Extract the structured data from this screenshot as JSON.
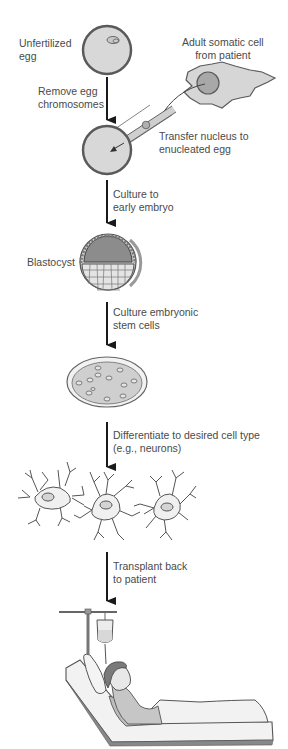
{
  "diagram": {
    "labels": {
      "unfertilized_egg": [
        "Unfertilized",
        "egg"
      ],
      "adult_cell": [
        "Adult somatic cell",
        "from patient"
      ],
      "remove_chromosomes": [
        "Remove egg",
        "chromosomes"
      ],
      "transfer_nucleus": [
        "Transfer nucleus to",
        "enucleated egg"
      ],
      "culture_embryo": [
        "Culture to",
        "early embryo"
      ],
      "blastocyst": [
        "Blastocyst"
      ],
      "culture_stem": [
        "Culture embryonic",
        "stem cells"
      ],
      "differentiate": [
        "Differentiate to desired cell type",
        "(e.g., neurons)"
      ],
      "transplant": [
        "Transplant back",
        "to patient"
      ]
    },
    "colors": {
      "cell_fill": "#d6d6d6",
      "cell_stroke": "#5a5a5a",
      "nucleus_fill": "#a8a8a8",
      "blastocyst_icm": "#8c8c8c",
      "text": "#4a4a4a",
      "arrow": "#1a1a1a"
    }
  }
}
